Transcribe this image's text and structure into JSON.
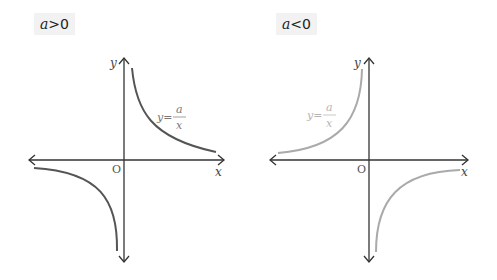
{
  "panels": [
    {
      "case_label_var": "a",
      "case_label_rel": ">0",
      "axis_y": "y",
      "axis_x": "x",
      "origin": "O",
      "equation": {
        "lhs": "y=",
        "numerator": "a",
        "denominator": "x"
      },
      "curve_color": "#555555",
      "equation_color": "#777777"
    },
    {
      "case_label_var": "a",
      "case_label_rel": "<0",
      "axis_y": "y",
      "axis_x": "x",
      "origin": "O",
      "equation": {
        "lhs": "y=",
        "numerator": "a",
        "denominator": "x"
      },
      "curve_color": "#aaaaaa",
      "equation_color": "#b5b5b5"
    }
  ],
  "colors": {
    "axis": "#333333",
    "label_bg": "#f2f2f2"
  }
}
